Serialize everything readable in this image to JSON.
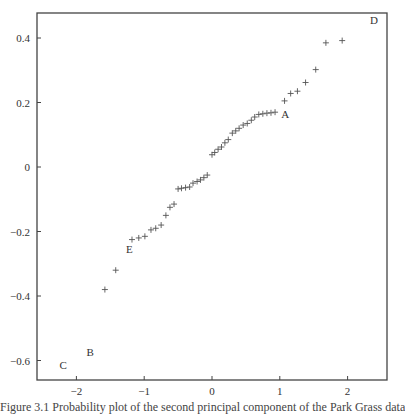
{
  "chart_data": {
    "type": "scatter",
    "title": "",
    "xlabel": "",
    "ylabel": "",
    "xlim": [
      -2.55,
      2.6
    ],
    "ylim": [
      -0.66,
      0.48
    ],
    "grid": false,
    "legend": null,
    "marker": "+",
    "x_ticks": [
      -2,
      -1,
      0,
      1,
      2
    ],
    "x_tick_labels": [
      "−2",
      "−1",
      "0",
      "1",
      "2"
    ],
    "y_ticks": [
      0.4,
      0.2,
      0,
      -0.2,
      -0.4,
      -0.6
    ],
    "y_tick_labels": [
      "0.4",
      "0.2",
      "0",
      "−0.2",
      "−0.4",
      "−0.6"
    ],
    "series": [
      {
        "name": "points",
        "x": [
          -1.58,
          -1.42,
          -1.18,
          -1.08,
          -0.99,
          -0.9,
          -0.83,
          -0.75,
          -0.68,
          -0.62,
          -0.56,
          -0.5,
          -0.45,
          -0.39,
          -0.33,
          -0.28,
          -0.22,
          -0.17,
          -0.12,
          -0.07,
          0.0,
          0.04,
          0.09,
          0.14,
          0.19,
          0.24,
          0.3,
          0.35,
          0.4,
          0.46,
          0.52,
          0.58,
          0.63,
          0.69,
          0.75,
          0.81,
          0.87,
          0.93,
          1.07,
          1.16,
          1.26,
          1.38,
          1.53,
          1.68,
          1.92
        ],
        "y": [
          -0.38,
          -0.32,
          -0.225,
          -0.22,
          -0.215,
          -0.195,
          -0.19,
          -0.18,
          -0.15,
          -0.125,
          -0.115,
          -0.068,
          -0.066,
          -0.064,
          -0.062,
          -0.05,
          -0.045,
          -0.04,
          -0.033,
          -0.025,
          0.038,
          0.045,
          0.055,
          0.062,
          0.075,
          0.085,
          0.105,
          0.112,
          0.12,
          0.13,
          0.135,
          0.145,
          0.155,
          0.163,
          0.165,
          0.167,
          0.168,
          0.17,
          0.205,
          0.228,
          0.235,
          0.262,
          0.302,
          0.385,
          0.392
        ]
      }
    ],
    "annotations": [
      {
        "text": "A",
        "x": 1.02,
        "y": 0.165
      },
      {
        "text": "B",
        "x": -1.85,
        "y": -0.575
      },
      {
        "text": "C",
        "x": -2.25,
        "y": -0.615
      },
      {
        "text": "D",
        "x": 2.33,
        "y": 0.455
      },
      {
        "text": "E",
        "x": -1.27,
        "y": -0.255
      }
    ]
  },
  "caption": "Figure 3.1  Probability plot of the second principal component of the Park Grass data"
}
